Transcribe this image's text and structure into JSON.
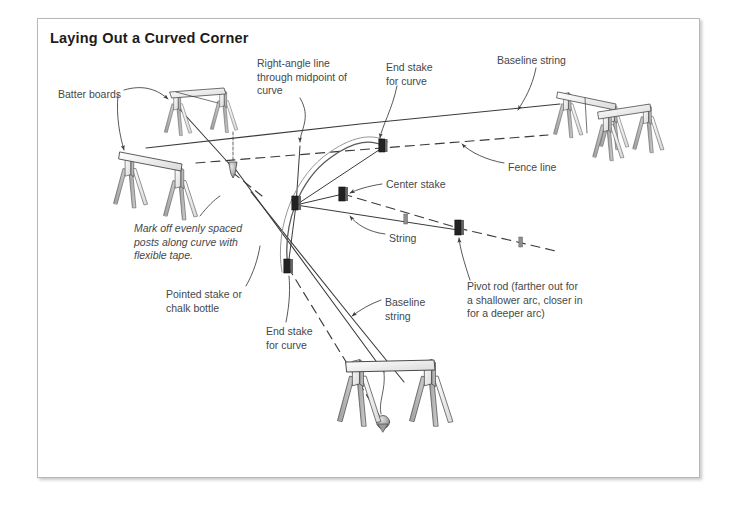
{
  "figure": {
    "title": "Laying Out a Curved Corner",
    "frame_border_color": "#b8b8b8",
    "background_color": "#ffffff",
    "ink_color": "#3a3a3a",
    "label_color": "#45484a"
  },
  "labels": [
    {
      "id": "batter-boards",
      "text": "Batter boards",
      "x": 58,
      "y": 88,
      "italic": false
    },
    {
      "id": "right-angle-line",
      "text": "Right-angle line\nthrough midpoint of\ncurve",
      "x": 257,
      "y": 57,
      "italic": false
    },
    {
      "id": "end-stake-for-curve-top",
      "text": "End stake\nfor curve",
      "x": 386,
      "y": 61,
      "italic": false
    },
    {
      "id": "baseline-string-top",
      "text": "Baseline string",
      "x": 497,
      "y": 54,
      "italic": false
    },
    {
      "id": "fence-line",
      "text": "Fence line",
      "x": 508,
      "y": 161,
      "italic": false
    },
    {
      "id": "center-stake",
      "text": "Center stake",
      "x": 386,
      "y": 178,
      "italic": false
    },
    {
      "id": "string",
      "text": "String",
      "x": 389,
      "y": 232,
      "italic": false
    },
    {
      "id": "mark-off-note",
      "text": "Mark off evenly spaced\nposts along curve with\nflexible tape.",
      "x": 134,
      "y": 222,
      "italic": true
    },
    {
      "id": "pointed-stake",
      "text": "Pointed stake or\nchalk bottle",
      "x": 166,
      "y": 288,
      "italic": false
    },
    {
      "id": "end-stake-for-curve-bottom",
      "text": "End stake\nfor curve",
      "x": 266,
      "y": 325,
      "italic": false
    },
    {
      "id": "baseline-string-bottom",
      "text": "Baseline\nstring",
      "x": 385,
      "y": 296,
      "italic": false
    },
    {
      "id": "pivot-rod",
      "text": "Pivot rod (farther out for\na shallower arc, closer in\nfor a deeper arc)",
      "x": 467,
      "y": 280,
      "italic": false
    }
  ],
  "diagram_elements": {
    "batter_board_assemblies": [
      {
        "id": "batter-board-upper-left",
        "x": 178,
        "y": 100
      },
      {
        "id": "batter-board-lower-left",
        "x": 132,
        "y": 165
      },
      {
        "id": "batter-board-right-rear",
        "x": 570,
        "y": 100
      },
      {
        "id": "batter-board-right-front",
        "x": 605,
        "y": 115
      },
      {
        "id": "batter-board-bottom",
        "x": 390,
        "y": 390
      }
    ],
    "strings": [
      {
        "id": "baseline-string-main",
        "style": "solid"
      },
      {
        "id": "baseline-string-lower",
        "style": "solid"
      },
      {
        "id": "radius-string",
        "style": "solid"
      }
    ],
    "fence_lines": [
      {
        "id": "fence-line-upper",
        "style": "dashed"
      },
      {
        "id": "fence-line-lower",
        "style": "dashed"
      }
    ],
    "curve": {
      "id": "curve-arc",
      "style": "solid"
    },
    "stakes": [
      {
        "id": "end-stake-top",
        "x": 382,
        "y": 146
      },
      {
        "id": "center-stake-pt",
        "x": 343,
        "y": 194
      },
      {
        "id": "curve-stake-left",
        "x": 296,
        "y": 203
      },
      {
        "id": "end-stake-bottom",
        "x": 288,
        "y": 267
      },
      {
        "id": "pivot-rod-stake",
        "x": 458,
        "y": 228
      },
      {
        "id": "post-mark-1",
        "x": 406,
        "y": 219
      },
      {
        "id": "post-mark-2",
        "x": 521,
        "y": 242
      }
    ],
    "plumb_bobs": [
      {
        "id": "plumb-bob-left",
        "x": 233,
        "y": 169
      },
      {
        "id": "plumb-bob-bottom",
        "x": 383,
        "y": 424
      }
    ]
  }
}
